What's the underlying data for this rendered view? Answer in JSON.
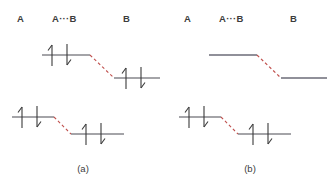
{
  "figure": {
    "kind": "energy-level-electron-pair-diagram",
    "background_color": "#ffffff",
    "line_color": "#4a4a52",
    "arrow_color": "#3a3a3a",
    "dashed_connector_color": "#c0504d",
    "panels": [
      {
        "id": "a",
        "caption": "(a)",
        "headers": [
          {
            "label": "A"
          },
          {
            "label": "A···B"
          },
          {
            "label": "B"
          }
        ],
        "diagrams": [
          {
            "id": "top",
            "position": "upper",
            "style": "electron-pairs",
            "levels": [
              {
                "side": "left",
                "electrons": [
                  "up",
                  "down"
                ]
              },
              {
                "side": "right",
                "electrons": [
                  "up",
                  "down"
                ]
              }
            ],
            "connector": {
              "style": "dashed",
              "color": "#c0504d",
              "direction": "descending"
            }
          },
          {
            "id": "bottom",
            "position": "lower",
            "style": "electron-pairs",
            "levels": [
              {
                "side": "left",
                "electrons": [
                  "up",
                  "down"
                ]
              },
              {
                "side": "right",
                "electrons": [
                  "up",
                  "down"
                ]
              }
            ],
            "connector": {
              "style": "dashed",
              "color": "#c0504d",
              "direction": "descending"
            }
          }
        ]
      },
      {
        "id": "b",
        "caption": "(b)",
        "headers": [
          {
            "label": "A"
          },
          {
            "label": "A···B"
          },
          {
            "label": "B"
          }
        ],
        "diagrams": [
          {
            "id": "top",
            "position": "upper",
            "style": "plain-levels",
            "levels": [
              {
                "side": "left",
                "electrons": []
              },
              {
                "side": "right",
                "electrons": []
              }
            ],
            "connector": {
              "style": "dashed",
              "color": "#c0504d",
              "direction": "descending"
            }
          },
          {
            "id": "bottom",
            "position": "lower",
            "style": "electron-pairs",
            "levels": [
              {
                "side": "left",
                "electrons": [
                  "up",
                  "down"
                ]
              },
              {
                "side": "right",
                "electrons": [
                  "up",
                  "down"
                ]
              }
            ],
            "connector": {
              "style": "dashed",
              "color": "#c0504d",
              "direction": "descending"
            }
          }
        ]
      }
    ]
  }
}
